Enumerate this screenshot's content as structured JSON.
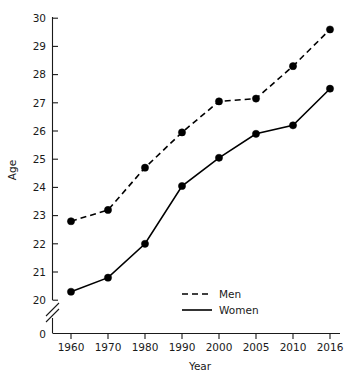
{
  "chart_data": {
    "type": "line",
    "title": "",
    "xlabel": "Year",
    "ylabel": "Age",
    "categories": [
      "1960",
      "1970",
      "1980",
      "1990",
      "2000",
      "2005",
      "2010",
      "2016"
    ],
    "series": [
      {
        "name": "Men",
        "style": "dashed",
        "values": [
          22.8,
          23.2,
          24.7,
          25.95,
          27.05,
          27.15,
          28.3,
          29.6
        ]
      },
      {
        "name": "Women",
        "style": "solid",
        "values": [
          20.3,
          20.8,
          22.0,
          24.05,
          25.05,
          25.9,
          26.2,
          27.5
        ]
      }
    ],
    "ylim": [
      20,
      30
    ],
    "yticks": [
      "20",
      "21",
      "22",
      "23",
      "24",
      "25",
      "26",
      "27",
      "28",
      "29",
      "30"
    ],
    "y_axis_break": true,
    "y_origin_label": "0",
    "grid": false,
    "legend_position": "inside-bottom-center",
    "marker": "filled-circle",
    "colors": {
      "men": "#000000",
      "women": "#000000",
      "axis": "#1a1a1a",
      "background": "#ffffff"
    }
  },
  "legend": {
    "entries": [
      {
        "label": "Men"
      },
      {
        "label": "Women"
      }
    ]
  },
  "axes": {
    "y_title": "Age",
    "x_title": "Year"
  }
}
